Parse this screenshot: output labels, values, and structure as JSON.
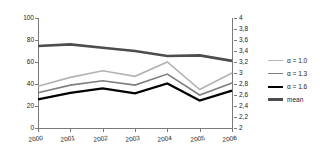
{
  "chart_data": {
    "type": "line",
    "title": "",
    "xlabel": "",
    "ylabel": "",
    "categories": [
      "2000",
      "2001",
      "2002",
      "2003",
      "2004",
      "2005",
      "2006"
    ],
    "grid": false,
    "legend_position": "right",
    "axes": {
      "left": {
        "ylim": [
          0,
          100
        ],
        "ticks": [
          0,
          20,
          40,
          60,
          80,
          100
        ],
        "tick_labels": [
          "0",
          "20",
          "40",
          "60",
          "80",
          "100"
        ],
        "applies_to": [
          "α = 1.0",
          "α = 1.3",
          "α = 1.6"
        ]
      },
      "right": {
        "ylim": [
          2,
          4
        ],
        "ticks": [
          2,
          2.2,
          2.4,
          2.6,
          2.8,
          3,
          3.2,
          3.4,
          3.6,
          3.8,
          4
        ],
        "tick_labels": [
          "2",
          "2,2",
          "2,4",
          "2,6",
          "2,8",
          "3",
          "3,2",
          "3,4",
          "3,6",
          "3,8",
          "4"
        ],
        "applies_to": [
          "mean"
        ]
      }
    },
    "series": [
      {
        "name": "α = 1.0",
        "axis": "left",
        "color": "#b3b3b3",
        "width": 1.6,
        "values": [
          38,
          46,
          52,
          47,
          60,
          35,
          50
        ]
      },
      {
        "name": "α = 1.3",
        "axis": "left",
        "color": "#7f7f7f",
        "width": 1.6,
        "values": [
          32,
          39,
          43,
          39,
          49,
          30,
          41
        ]
      },
      {
        "name": "α = 1.6",
        "axis": "left",
        "color": "#000000",
        "width": 2.2,
        "values": [
          26,
          32,
          36,
          31.5,
          40.5,
          25,
          34
        ]
      },
      {
        "name": "mean",
        "axis": "right",
        "color": "#4d4d4d",
        "width": 2.6,
        "values": [
          3.49,
          3.52,
          3.46,
          3.4,
          3.31,
          3.32,
          3.22
        ]
      }
    ]
  },
  "legend": {
    "items": [
      {
        "label": "α = 1.0",
        "color": "#b3b3b3",
        "width": 1.6
      },
      {
        "label": "α = 1.3",
        "color": "#7f7f7f",
        "width": 1.8
      },
      {
        "label": "α = 1.6",
        "color": "#000000",
        "width": 2.6
      },
      {
        "label": "mean",
        "color": "#4d4d4d",
        "width": 3.2
      }
    ]
  },
  "colors": {
    "axis": "#7a7a7a",
    "text": "#1a1a1a",
    "background": "#ffffff"
  }
}
